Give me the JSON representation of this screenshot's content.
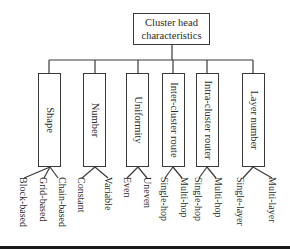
{
  "diagram": {
    "type": "tree",
    "root": {
      "line1": "Cluster head",
      "line2": "characteristics"
    },
    "categories": [
      {
        "label": "Shape",
        "children": [
          "Block-based",
          "Grid-based",
          "Chain-based"
        ]
      },
      {
        "label": "Number",
        "children": [
          "Constant",
          "Variable"
        ]
      },
      {
        "label": "Uniformity",
        "children": [
          "Even",
          "Uneven"
        ]
      },
      {
        "label": "Inter-cluster route",
        "children": [
          "Single-hop",
          "Multi-hop"
        ]
      },
      {
        "label": "Intra-cluster router",
        "children": [
          "Single-hop",
          "Multi-hop"
        ]
      },
      {
        "label": "Layer number",
        "children": [
          "Single-layer",
          "Multi-layer"
        ]
      }
    ],
    "colors": {
      "line": "#3a3a3a",
      "text": "#2a2a2a",
      "rule": "#1a1a1a"
    }
  }
}
